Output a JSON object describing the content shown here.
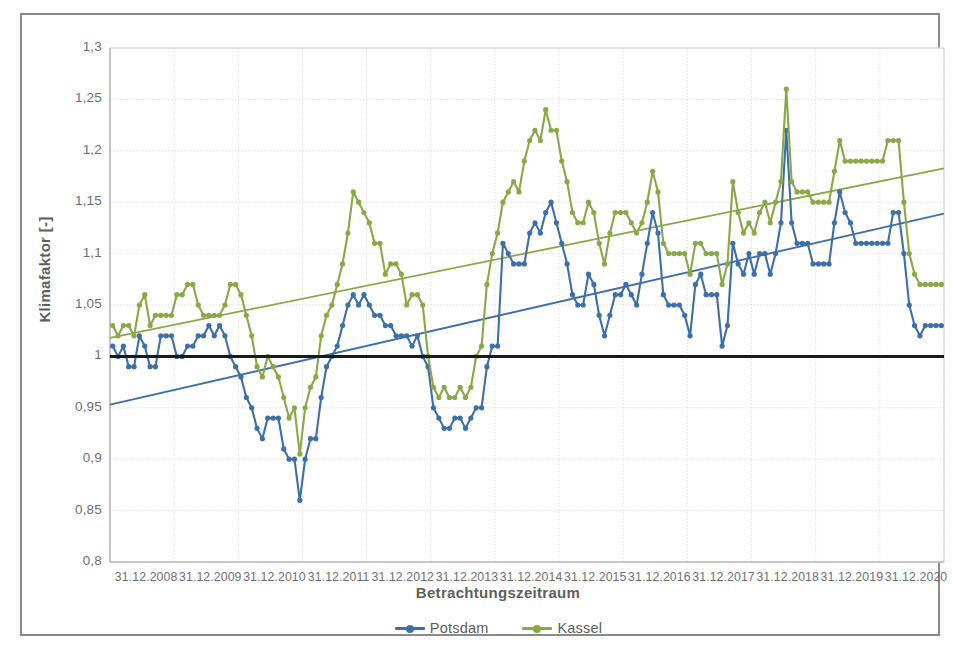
{
  "chart_data": {
    "type": "line",
    "title": "",
    "xlabel": "Betrachtungszeitraum",
    "ylabel": "Klimafaktor [-]",
    "ylim": [
      0.8,
      1.3
    ],
    "ytick_labels": [
      "1,3",
      "1,25",
      "1,2",
      "1,15",
      "1,1",
      "1,05",
      "1",
      "0,95",
      "0,9",
      "0,85",
      "0,8"
    ],
    "ytick_values": [
      1.3,
      1.25,
      1.2,
      1.15,
      1.1,
      1.05,
      1.0,
      0.95,
      0.9,
      0.85,
      0.8
    ],
    "xtick_labels": [
      "31.12.2008",
      "31.12.2009",
      "31.12.2010",
      "31.12.2011",
      "31.12.2012",
      "31.12.2013",
      "31.12.2014",
      "31.12.2015",
      "31.12.2016",
      "31.12.2017",
      "31.12.2018",
      "31.12.2019",
      "31.12.2020"
    ],
    "xlim_years": [
      2008.0,
      2021.0
    ],
    "grid": true,
    "legend_position": "bottom",
    "reference_line": {
      "name": "Referenz 1,0",
      "value": 1.0,
      "color": "#1a1a1a"
    },
    "series": [
      {
        "name": "Potsdam",
        "color": "#3d6fa8",
        "marker": "circle",
        "values": [
          1.01,
          1.0,
          1.01,
          0.99,
          0.99,
          1.02,
          1.01,
          0.99,
          0.99,
          1.02,
          1.02,
          1.02,
          1.0,
          1.0,
          1.01,
          1.01,
          1.02,
          1.02,
          1.03,
          1.02,
          1.03,
          1.02,
          1.0,
          0.99,
          0.98,
          0.96,
          0.95,
          0.93,
          0.92,
          0.94,
          0.94,
          0.94,
          0.91,
          0.9,
          0.9,
          0.86,
          0.9,
          0.92,
          0.92,
          0.96,
          0.99,
          1.0,
          1.01,
          1.03,
          1.05,
          1.06,
          1.05,
          1.06,
          1.05,
          1.04,
          1.04,
          1.03,
          1.03,
          1.02,
          1.02,
          1.02,
          1.01,
          1.02,
          1.0,
          0.99,
          0.95,
          0.94,
          0.93,
          0.93,
          0.94,
          0.94,
          0.93,
          0.94,
          0.95,
          0.95,
          0.99,
          1.01,
          1.01,
          1.11,
          1.1,
          1.09,
          1.09,
          1.09,
          1.12,
          1.13,
          1.12,
          1.14,
          1.15,
          1.13,
          1.11,
          1.09,
          1.06,
          1.05,
          1.05,
          1.08,
          1.07,
          1.04,
          1.02,
          1.04,
          1.06,
          1.06,
          1.07,
          1.06,
          1.05,
          1.08,
          1.11,
          1.14,
          1.12,
          1.06,
          1.05,
          1.05,
          1.05,
          1.04,
          1.02,
          1.07,
          1.08,
          1.06,
          1.06,
          1.06,
          1.01,
          1.03,
          1.11,
          1.09,
          1.08,
          1.1,
          1.08,
          1.1,
          1.1,
          1.08,
          1.1,
          1.13,
          1.22,
          1.13,
          1.11,
          1.11,
          1.11,
          1.09,
          1.09,
          1.09,
          1.09,
          1.13,
          1.16,
          1.14,
          1.13,
          1.11,
          1.11,
          1.11,
          1.11,
          1.11,
          1.11,
          1.11,
          1.14,
          1.14,
          1.1,
          1.05,
          1.03,
          1.02,
          1.03,
          1.03,
          1.03,
          1.03
        ]
      },
      {
        "name": "Kassel",
        "color": "#8aa847",
        "marker": "circle",
        "values": [
          1.03,
          1.02,
          1.03,
          1.03,
          1.02,
          1.05,
          1.06,
          1.03,
          1.04,
          1.04,
          1.04,
          1.04,
          1.06,
          1.06,
          1.07,
          1.07,
          1.05,
          1.04,
          1.04,
          1.04,
          1.04,
          1.05,
          1.07,
          1.07,
          1.06,
          1.04,
          1.02,
          0.99,
          0.98,
          1.0,
          0.99,
          0.98,
          0.96,
          0.94,
          0.95,
          0.905,
          0.95,
          0.97,
          0.98,
          1.02,
          1.04,
          1.05,
          1.07,
          1.09,
          1.12,
          1.16,
          1.15,
          1.14,
          1.13,
          1.11,
          1.11,
          1.08,
          1.09,
          1.09,
          1.08,
          1.05,
          1.06,
          1.06,
          1.05,
          1.0,
          0.97,
          0.96,
          0.97,
          0.96,
          0.96,
          0.97,
          0.96,
          0.97,
          1.0,
          1.01,
          1.07,
          1.1,
          1.12,
          1.15,
          1.16,
          1.17,
          1.16,
          1.19,
          1.21,
          1.22,
          1.21,
          1.24,
          1.22,
          1.22,
          1.19,
          1.17,
          1.14,
          1.13,
          1.13,
          1.15,
          1.14,
          1.11,
          1.09,
          1.12,
          1.14,
          1.14,
          1.14,
          1.13,
          1.12,
          1.13,
          1.15,
          1.18,
          1.16,
          1.11,
          1.1,
          1.1,
          1.1,
          1.1,
          1.08,
          1.11,
          1.11,
          1.1,
          1.1,
          1.1,
          1.07,
          1.09,
          1.17,
          1.14,
          1.12,
          1.13,
          1.12,
          1.14,
          1.15,
          1.13,
          1.15,
          1.17,
          1.26,
          1.17,
          1.16,
          1.16,
          1.16,
          1.15,
          1.15,
          1.15,
          1.15,
          1.18,
          1.21,
          1.19,
          1.19,
          1.19,
          1.19,
          1.19,
          1.19,
          1.19,
          1.19,
          1.21,
          1.21,
          1.21,
          1.15,
          1.1,
          1.08,
          1.07,
          1.07,
          1.07,
          1.07,
          1.07
        ]
      }
    ],
    "trendlines": [
      {
        "name": "Potsdam Trend",
        "color": "#3d6fa8",
        "y_start": 0.953,
        "y_end": 1.139
      },
      {
        "name": "Kassel Trend",
        "color": "#8aa847",
        "y_start": 1.018,
        "y_end": 1.183
      }
    ]
  },
  "legend": {
    "items": [
      {
        "label": "Potsdam",
        "color": "#3d6fa8"
      },
      {
        "label": "Kassel",
        "color": "#8aa847"
      }
    ]
  }
}
